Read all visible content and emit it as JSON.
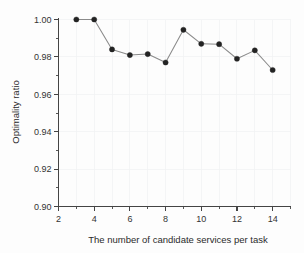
{
  "chart_data": {
    "type": "line",
    "title": "",
    "xlabel": "The number of candidate services per task",
    "ylabel": "Optimality ratio",
    "xlim": [
      2,
      15
    ],
    "ylim": [
      0.9,
      1.0
    ],
    "grid": true,
    "legend": null,
    "x_major_ticks": [
      2,
      4,
      6,
      8,
      10,
      12,
      14
    ],
    "x_major_tick_labels": [
      "2",
      "4",
      "6",
      "8",
      "10",
      "12",
      "14"
    ],
    "x_minor_ticks": [
      3,
      5,
      7,
      9,
      11,
      13,
      15
    ],
    "y_major_ticks": [
      0.9,
      0.92,
      0.94,
      0.96,
      0.98,
      1.0
    ],
    "y_major_tick_labels": [
      "0.90",
      "0.92",
      "0.94",
      "0.96",
      "0.98",
      "1.00"
    ],
    "y_minor_ticks": [
      0.91,
      0.93,
      0.95,
      0.97,
      0.99
    ],
    "marker": "filled-circle",
    "marker_color": "#232323",
    "line_color": "#8a8a8a",
    "series": [
      {
        "name": "Optimality ratio",
        "x": [
          3,
          4,
          5,
          6,
          7,
          8,
          9,
          10,
          11,
          12,
          13,
          14
        ],
        "values": [
          1.0,
          1.0,
          0.984,
          0.981,
          0.9815,
          0.977,
          0.9945,
          0.987,
          0.9868,
          0.979,
          0.9835,
          0.973
        ]
      }
    ]
  },
  "labels": {
    "x_axis_title": "The number of candidate services per task",
    "y_axis_title": "Optimality ratio"
  }
}
